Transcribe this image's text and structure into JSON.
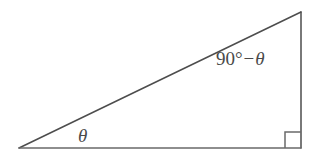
{
  "figure": {
    "name": "right-triangle-with-complementary-angles",
    "background_color": "#ffffff",
    "width": 323,
    "height": 166
  },
  "triangle": {
    "stroke_color": "#4d4d4d",
    "base_stroke_color": "#6a6a6a",
    "stroke_width": 1.5,
    "vertices": {
      "left": [
        19,
        148
      ],
      "apex": [
        301,
        12
      ],
      "right": [
        301,
        148
      ]
    }
  },
  "right_angle_marker": {
    "label": "right-angle-marker",
    "size": 16,
    "stroke_color": "#6a6a6a"
  },
  "labels": {
    "theta": "θ",
    "complement_number": "90",
    "complement_degree": "°",
    "complement_operator": "−",
    "complement_variable": "θ"
  }
}
